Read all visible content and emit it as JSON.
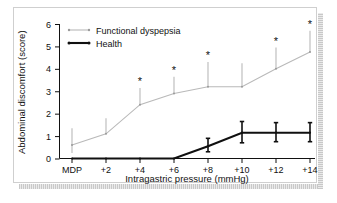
{
  "chart_data": {
    "type": "line",
    "title": "",
    "xlabel": "Intragastric pressure (mmHg)",
    "ylabel": "Abdominal discomfort (score)",
    "categories": [
      "MDP",
      "+2",
      "+4",
      "+6",
      "+8",
      "+10",
      "+12",
      "+14"
    ],
    "ylim": [
      0,
      6
    ],
    "yticks": [
      "0",
      "1",
      "2",
      "3",
      "4",
      "5",
      "6"
    ],
    "grid": false,
    "legend_position": "top-left",
    "series": [
      {
        "name": "Functional dyspepsia",
        "color": "#b9b9b9",
        "values": [
          0.6,
          1.1,
          2.4,
          2.9,
          3.2,
          3.2,
          4.0,
          4.75
        ],
        "error_upper": [
          1.35,
          1.8,
          3.15,
          3.65,
          4.3,
          4.25,
          4.95,
          5.7
        ],
        "error_lower": [
          0.25,
          1.1,
          2.4,
          2.9,
          3.2,
          3.2,
          4.0,
          4.75
        ],
        "significance": [
          "",
          "",
          "*",
          "*",
          "*",
          "",
          "*",
          "*"
        ]
      },
      {
        "name": "Health",
        "color": "#101010",
        "values": [
          0.0,
          0.0,
          0.0,
          0.0,
          0.55,
          1.15,
          1.15,
          1.15
        ],
        "error_upper": [
          0.0,
          0.0,
          0.0,
          0.0,
          0.9,
          1.65,
          1.6,
          1.6
        ],
        "error_lower": [
          0.0,
          0.0,
          0.0,
          0.0,
          0.3,
          0.7,
          0.75,
          0.75
        ],
        "significance": [
          "",
          "",
          "",
          "",
          "",
          "",
          "",
          ""
        ]
      }
    ],
    "significance_marker": "*"
  }
}
